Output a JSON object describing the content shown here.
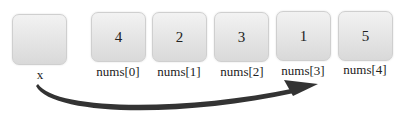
{
  "variable": {
    "label": "x",
    "value": ""
  },
  "array": [
    {
      "value": "4",
      "label": "nums[0]"
    },
    {
      "value": "2",
      "label": "nums[1]"
    },
    {
      "value": "3",
      "label": "nums[2]"
    },
    {
      "value": "1",
      "label": "nums[3]"
    },
    {
      "value": "5",
      "label": "nums[4]"
    }
  ],
  "arrow": {
    "from": "x",
    "to": "nums[3]",
    "color": "#333333"
  }
}
